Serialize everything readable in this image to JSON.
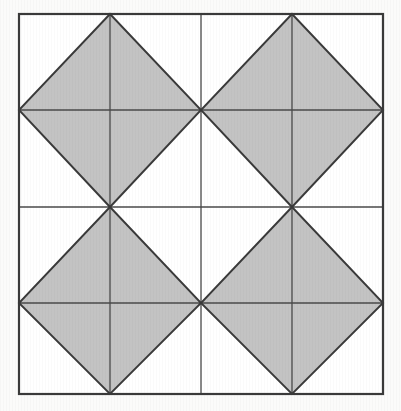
{
  "figure": {
    "canvas": {
      "width": 401,
      "height": 411
    },
    "background_color": "#fbfbfa",
    "colors": {
      "page_background": "#fbfbfa",
      "frame_fill": "#ffffff",
      "shaded_fill": "#c3c3c3",
      "stroke": "#3a3a3a",
      "thin_stroke": "#4a4a4a",
      "frame_stroke": "#3a3a3a"
    },
    "frame": {
      "x": 19,
      "y": 14,
      "width": 364,
      "height": 380,
      "stroke_width": 2.2
    },
    "grid": {
      "vertical_x": [
        19,
        110,
        201,
        292,
        383
      ],
      "horizontal_y": [
        14,
        110,
        207,
        303,
        394
      ],
      "interior_stroke_width": 1.5,
      "quarter_stroke_width": 1.3
    },
    "diamonds": [
      {
        "name": "top-left-diamond",
        "shaded": true,
        "center": [
          110,
          110
        ],
        "vertices": [
          [
            110,
            14
          ],
          [
            201,
            110
          ],
          [
            110,
            207
          ],
          [
            19,
            110
          ]
        ],
        "diagonals": [
          "vertical",
          "horizontal"
        ],
        "triangles": 4
      },
      {
        "name": "top-right-diamond",
        "shaded": true,
        "center": [
          292,
          110
        ],
        "vertices": [
          [
            292,
            14
          ],
          [
            383,
            110
          ],
          [
            292,
            207
          ],
          [
            201,
            110
          ]
        ],
        "diagonals": [
          "vertical",
          "horizontal"
        ],
        "triangles": 4
      },
      {
        "name": "bottom-left-diamond",
        "shaded": true,
        "center": [
          110,
          303
        ],
        "vertices": [
          [
            110,
            207
          ],
          [
            201,
            303
          ],
          [
            110,
            394
          ],
          [
            19,
            303
          ]
        ],
        "diagonals": [
          "vertical",
          "horizontal"
        ],
        "triangles": 4
      },
      {
        "name": "bottom-right-diamond",
        "shaded": true,
        "center": [
          292,
          303
        ],
        "vertices": [
          [
            292,
            207
          ],
          [
            383,
            303
          ],
          [
            292,
            394
          ],
          [
            201,
            303
          ]
        ],
        "diagonals": [
          "vertical",
          "horizontal"
        ],
        "triangles": 4
      }
    ],
    "counts": {
      "diamonds": 4,
      "shaded_diamonds": 4,
      "unshaded_regions": 13,
      "triangles_per_diamond": 4,
      "total_shaded_triangles": 16
    },
    "labels": [],
    "annotations": []
  }
}
